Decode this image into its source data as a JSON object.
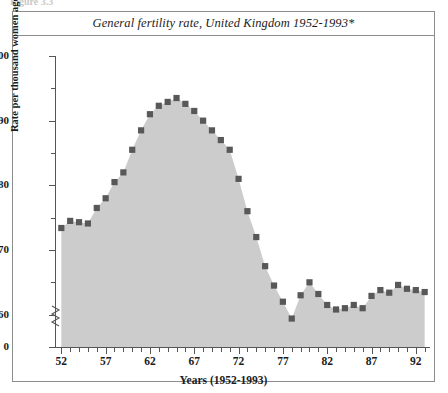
{
  "figure_caption": "Figure 3.3",
  "panel": {
    "title": "General fertility rate, United Kingdom 1952-1993*",
    "footnote": "* Rates for 1952-1959 exclude Northern Ireland"
  },
  "axes": {
    "y_label": "Rate per thousand women aged 15-44",
    "x_label": "Years (1952-1993)",
    "y_major_ticks": [
      "100",
      "90",
      "80",
      "70",
      "60",
      "0"
    ],
    "x_major_ticks": [
      "52",
      "57",
      "62",
      "67",
      "72",
      "77",
      "82",
      "87",
      "92"
    ],
    "axis_break": true
  },
  "colors": {
    "marker": "#585858",
    "area_fill": "#cccccc",
    "frame": "#8d8d8d",
    "axis": "#555555",
    "text": "#1b1b1b"
  },
  "chart_data": {
    "type": "line",
    "title": "General fertility rate, United Kingdom 1952-1993*",
    "xlabel": "Years (1952-1993)",
    "ylabel": "Rate per thousand women aged 15-44",
    "xlim": [
      1951.4,
      1993.6
    ],
    "ylim": [
      55,
      100
    ],
    "ytick_values": [
      100,
      90,
      80,
      70,
      60
    ],
    "yminor_values": [
      95,
      85,
      75,
      65
    ],
    "xtick_values": [
      1952,
      1957,
      1962,
      1967,
      1972,
      1977,
      1982,
      1987,
      1992
    ],
    "grid": false,
    "legend": "none",
    "marker": "square",
    "fill_to_baseline": true,
    "note": "Values are general fertility rate per thousand women aged 15-44; y-axis has a break between 0 and ~57.",
    "x": [
      1952,
      1953,
      1954,
      1955,
      1956,
      1957,
      1958,
      1959,
      1960,
      1961,
      1962,
      1963,
      1964,
      1965,
      1966,
      1967,
      1968,
      1969,
      1970,
      1971,
      1972,
      1973,
      1974,
      1975,
      1976,
      1977,
      1978,
      1979,
      1980,
      1981,
      1982,
      1983,
      1984,
      1985,
      1986,
      1987,
      1988,
      1989,
      1990,
      1991,
      1992,
      1993
    ],
    "values": [
      73.4,
      74.5,
      74.3,
      74.1,
      76.5,
      78.0,
      80.5,
      82.0,
      85.5,
      88.5,
      91.0,
      92.3,
      92.9,
      93.5,
      92.6,
      91.5,
      90.0,
      88.5,
      87.0,
      85.5,
      81.0,
      76.0,
      72.0,
      67.5,
      64.5,
      62.0,
      59.4,
      63.0,
      65.0,
      63.2,
      61.5,
      60.8,
      61.0,
      61.5,
      61.0,
      62.9,
      63.8,
      63.4,
      64.6,
      64.0,
      63.8,
      63.5
    ]
  }
}
